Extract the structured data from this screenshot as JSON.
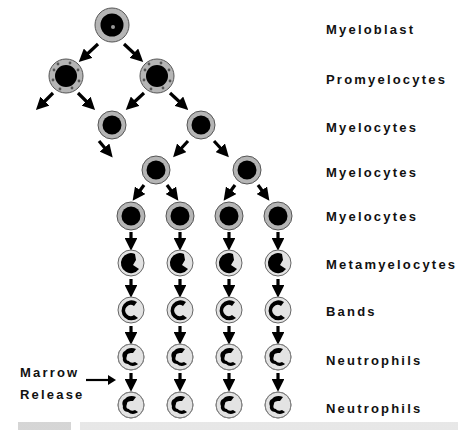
{
  "stages": [
    {
      "label": "Myeloblast",
      "cell_type": "myeloblast",
      "count": 1
    },
    {
      "label": "Promyelocytes",
      "cell_type": "promyelocyte",
      "count": 2
    },
    {
      "label": "Myelocytes",
      "cell_type": "myelocyte",
      "count": 2
    },
    {
      "label": "Myelocytes",
      "cell_type": "myelocyte",
      "count": 2
    },
    {
      "label": "Myelocytes",
      "cell_type": "myelocyte",
      "count": 4
    },
    {
      "label": "Metamyelocytes",
      "cell_type": "metamyelocyte",
      "count": 4
    },
    {
      "label": "Bands",
      "cell_type": "band",
      "count": 4
    },
    {
      "label": "Neutrophils",
      "cell_type": "neutrophil",
      "count": 4
    },
    {
      "label": "Neutrophils",
      "cell_type": "neutrophil",
      "count": 4
    }
  ],
  "marrow_release": {
    "line1": "Marrow",
    "line2": "Release"
  },
  "colors": {
    "cell_ring": "#b5b5b5",
    "cell_fill_light": "#e6e6e6",
    "nucleus": "#000000",
    "arrow": "#000000"
  }
}
